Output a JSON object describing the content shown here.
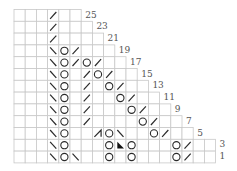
{
  "chart_title": "Knitting lace chart",
  "grid": {
    "left": 14,
    "top": 9.5,
    "cell_w": 11.2,
    "cell_h": 11.8,
    "line_color": "#c8c8c8",
    "symbol_color": "#2a2a2a",
    "label_color": "#555555"
  },
  "legend_symbols": {
    "/": "k2tog (right-leaning decrease)",
    "\\": "ssk (left-leaning decrease)",
    "O": "yarn over",
    "tri": "black triangle (no stitch / special)",
    "slashbar": "double decrease"
  },
  "rows": [
    {
      "label": "25",
      "cols": 6,
      "symbols": [
        [
          3,
          "/"
        ]
      ]
    },
    {
      "label": "23",
      "cols": 7,
      "symbols": [
        [
          3,
          "/"
        ]
      ]
    },
    {
      "label": "21",
      "cols": 8,
      "symbols": [
        [
          3,
          "/"
        ]
      ]
    },
    {
      "label": "19",
      "cols": 9,
      "symbols": [
        [
          3,
          "\\"
        ],
        [
          4,
          "O"
        ],
        [
          5,
          "/"
        ]
      ]
    },
    {
      "label": "17",
      "cols": 10,
      "symbols": [
        [
          3,
          "\\"
        ],
        [
          4,
          "O"
        ],
        [
          5,
          "/"
        ],
        [
          6,
          "O"
        ],
        [
          7,
          "/"
        ]
      ]
    },
    {
      "label": "15",
      "cols": 11,
      "symbols": [
        [
          3,
          "\\"
        ],
        [
          4,
          "O"
        ],
        [
          6,
          "/"
        ],
        [
          7,
          "O"
        ],
        [
          8,
          "/"
        ]
      ]
    },
    {
      "label": "13",
      "cols": 12,
      "symbols": [
        [
          3,
          "\\"
        ],
        [
          4,
          "O"
        ],
        [
          6,
          "/"
        ],
        [
          8,
          "O"
        ],
        [
          9,
          "/"
        ]
      ]
    },
    {
      "label": "11",
      "cols": 13,
      "symbols": [
        [
          3,
          "\\"
        ],
        [
          4,
          "O"
        ],
        [
          6,
          "/"
        ],
        [
          9,
          "O"
        ],
        [
          10,
          "/"
        ]
      ]
    },
    {
      "label": "9",
      "cols": 14,
      "symbols": [
        [
          3,
          "\\"
        ],
        [
          4,
          "O"
        ],
        [
          6,
          "/"
        ],
        [
          10,
          "O"
        ],
        [
          11,
          "/"
        ]
      ]
    },
    {
      "label": "7",
      "cols": 15,
      "symbols": [
        [
          3,
          "\\"
        ],
        [
          4,
          "O"
        ],
        [
          6,
          "/"
        ],
        [
          11,
          "O"
        ],
        [
          12,
          "/"
        ]
      ]
    },
    {
      "label": "5",
      "cols": 16,
      "symbols": [
        [
          3,
          "\\"
        ],
        [
          4,
          "O"
        ],
        [
          7,
          "slashbar"
        ],
        [
          8,
          "O"
        ],
        [
          9,
          "\\"
        ],
        [
          12,
          "O"
        ],
        [
          13,
          "/"
        ]
      ]
    },
    {
      "label": "3",
      "cols": 18,
      "symbols": [
        [
          3,
          "\\"
        ],
        [
          4,
          "O"
        ],
        [
          8,
          "O"
        ],
        [
          9,
          "tri"
        ],
        [
          10,
          "O"
        ],
        [
          14,
          "O"
        ],
        [
          15,
          "/"
        ]
      ]
    },
    {
      "label": "1",
      "cols": 18,
      "symbols": [
        [
          3,
          "\\"
        ],
        [
          4,
          "O"
        ],
        [
          5,
          "\\"
        ],
        [
          8,
          "O"
        ],
        [
          10,
          "O"
        ],
        [
          14,
          "O"
        ],
        [
          15,
          "/"
        ]
      ]
    }
  ]
}
